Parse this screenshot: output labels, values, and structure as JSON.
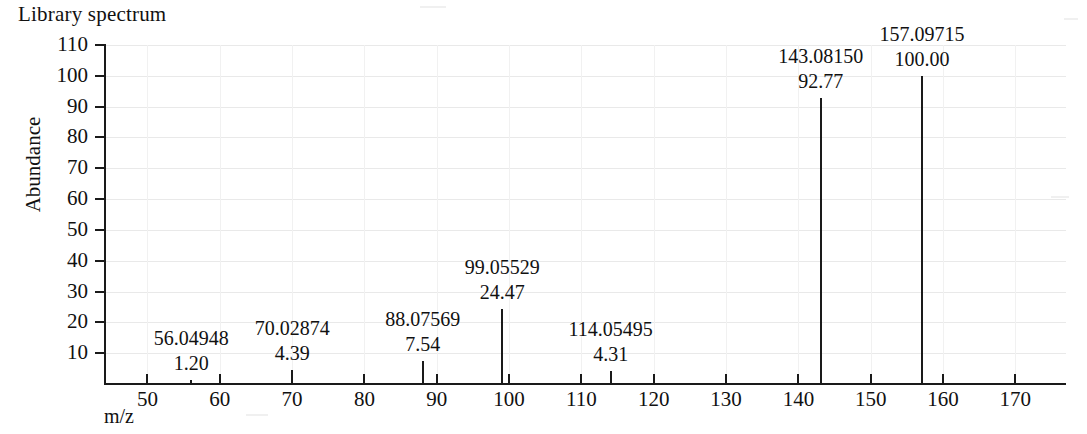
{
  "title": "Library spectrum",
  "axes": {
    "x_label": "m/z",
    "y_label": "Abundance",
    "x_ticks": [
      50,
      60,
      70,
      80,
      90,
      100,
      110,
      120,
      130,
      140,
      150,
      160,
      170
    ],
    "y_ticks": [
      10,
      20,
      30,
      40,
      50,
      60,
      70,
      80,
      90,
      100,
      110
    ]
  },
  "chart_data": {
    "type": "bar",
    "title": "Library spectrum",
    "xlabel": "m/z",
    "ylabel": "Abundance",
    "xlim": [
      44,
      177
    ],
    "ylim": [
      0,
      110
    ],
    "grid": true,
    "legend": "none",
    "x": [
      56.04948,
      70.02874,
      88.07569,
      99.05529,
      114.05495,
      143.0815,
      157.09715
    ],
    "values": [
      1.2,
      4.39,
      7.54,
      24.47,
      4.31,
      92.77,
      100.0
    ],
    "labels": [
      {
        "mass": "56.04948",
        "intensity": "1.20"
      },
      {
        "mass": "70.02874",
        "intensity": "4.39"
      },
      {
        "mass": "88.07569",
        "intensity": "7.54"
      },
      {
        "mass": "99.05529",
        "intensity": "24.47"
      },
      {
        "mass": "114.05495",
        "intensity": "4.31"
      },
      {
        "mass": "143.08150",
        "intensity": "92.77"
      },
      {
        "mass": "157.09715",
        "intensity": "100.00"
      }
    ]
  },
  "colors": {
    "ink": "#1a1a1a",
    "grid": "#e9e9e9",
    "background": "#ffffff"
  }
}
